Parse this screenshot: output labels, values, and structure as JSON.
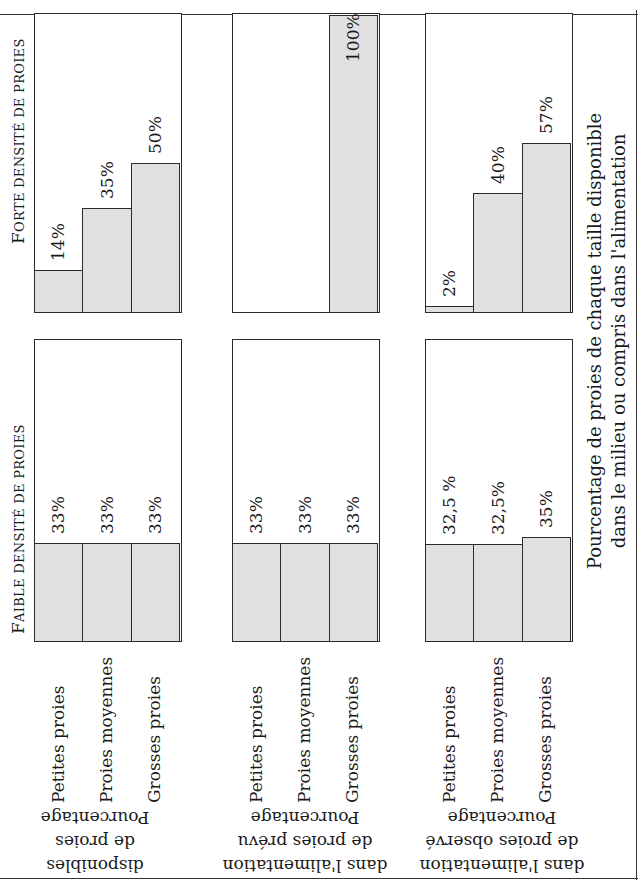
{
  "headings": {
    "high_density": {
      "first": "F",
      "rest": "orte densité de proies"
    },
    "low_density": {
      "first": "F",
      "rest": "aible densité de proies"
    }
  },
  "categories": [
    "Petites proies",
    "Proies moyennes",
    "Grosses proies"
  ],
  "rows": [
    {
      "label_lines": [
        "Pourcentage",
        "de proies",
        "disponibles"
      ],
      "high_density": [
        {
          "category": "Petites proies",
          "value": 14,
          "label": "14%"
        },
        {
          "category": "Proies moyennes",
          "value": 35,
          "label": "35%"
        },
        {
          "category": "Grosses proies",
          "value": 50,
          "label": "50%"
        }
      ],
      "low_density": [
        {
          "category": "Petites proies",
          "value": 33,
          "label": "33%"
        },
        {
          "category": "Proies moyennes",
          "value": 33,
          "label": "33%"
        },
        {
          "category": "Grosses proies",
          "value": 33,
          "label": "33%"
        }
      ]
    },
    {
      "label_lines": [
        "Pourcentage",
        "de proies prévu",
        "dans l'alimentation"
      ],
      "high_density": [
        {
          "category": "Petites proies",
          "value": 0,
          "label": ""
        },
        {
          "category": "Proies moyennes",
          "value": 0,
          "label": ""
        },
        {
          "category": "Grosses proies",
          "value": 100,
          "label": "100%"
        }
      ],
      "low_density": [
        {
          "category": "Petites proies",
          "value": 33,
          "label": "33%"
        },
        {
          "category": "Proies moyennes",
          "value": 33,
          "label": "33%"
        },
        {
          "category": "Grosses proies",
          "value": 33,
          "label": "33%"
        }
      ]
    },
    {
      "label_lines": [
        "Pourcentage",
        "de proies observé",
        "dans l'alimentation"
      ],
      "high_density": [
        {
          "category": "Petites proies",
          "value": 2,
          "label": "2%"
        },
        {
          "category": "Proies moyennes",
          "value": 40,
          "label": "40%"
        },
        {
          "category": "Grosses proies",
          "value": 57,
          "label": "57%"
        }
      ],
      "low_density": [
        {
          "category": "Petites proies",
          "value": 32.5,
          "label": "32,5 %"
        },
        {
          "category": "Proies moyennes",
          "value": 32.5,
          "label": "32,5%"
        },
        {
          "category": "Grosses proies",
          "value": 35,
          "label": "35%"
        }
      ]
    }
  ],
  "caption": {
    "line1": "Pourcentage de proies de chaque taille disponible",
    "line2": "dans le milieu ou compris dans l'alimentation"
  },
  "colors": {
    "bar_fill": "#e0e0e0",
    "outline": "#2a2a2a",
    "background": "#ffffff"
  },
  "chart_data": {
    "type": "bar",
    "orientation": "horizontal (image rotated 90° counter-clockwise)",
    "title": "",
    "xlabel": "Pourcentage de proies de chaque taille disponible dans le milieu ou compris dans l'alimentation",
    "ylabel": "",
    "xlim": [
      0,
      100
    ],
    "categories": [
      "Petites proies",
      "Proies moyennes",
      "Grosses proies"
    ],
    "panels": [
      {
        "density": "Faible densité de proies",
        "row": "Pourcentage de proies disponibles",
        "values": [
          33,
          33,
          33
        ]
      },
      {
        "density": "Faible densité de proies",
        "row": "Pourcentage de proies prévu dans l'alimentation",
        "values": [
          33,
          33,
          33
        ]
      },
      {
        "density": "Faible densité de proies",
        "row": "Pourcentage de proies observé dans l'alimentation",
        "values": [
          32.5,
          32.5,
          35
        ]
      },
      {
        "density": "Forte densité de proies",
        "row": "Pourcentage de proies disponibles",
        "values": [
          14,
          35,
          50
        ]
      },
      {
        "density": "Forte densité de proies",
        "row": "Pourcentage de proies prévu dans l'alimentation",
        "values": [
          0,
          0,
          100
        ]
      },
      {
        "density": "Forte densité de proies",
        "row": "Pourcentage de proies observé dans l'alimentation",
        "values": [
          2,
          40,
          57
        ]
      }
    ],
    "series": [
      {
        "name": "Faible densité - disponibles",
        "values": [
          33,
          33,
          33
        ]
      },
      {
        "name": "Faible densité - prévu",
        "values": [
          33,
          33,
          33
        ]
      },
      {
        "name": "Faible densité - observé",
        "values": [
          32.5,
          32.5,
          35
        ]
      },
      {
        "name": "Forte densité - disponibles",
        "values": [
          14,
          35,
          50
        ]
      },
      {
        "name": "Forte densité - prévu",
        "values": [
          0,
          0,
          100
        ]
      },
      {
        "name": "Forte densité - observé",
        "values": [
          2,
          40,
          57
        ]
      }
    ],
    "grid": false,
    "legend": null
  }
}
